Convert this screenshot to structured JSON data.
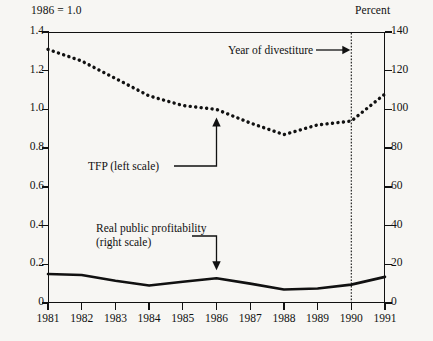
{
  "header": {
    "left_note": "1986 = 1.0",
    "right_note": "Percent"
  },
  "annotations": {
    "divestiture": "Year of divestiture",
    "tfp": "TFP (left scale)",
    "profit_line1": "Real public profitability",
    "profit_line2": "(right scale)"
  },
  "chart_data": {
    "type": "line",
    "title": "",
    "subtitle": "",
    "xlabel": "",
    "ylabel": "1986 = 1.0",
    "y2label": "Percent",
    "grid": false,
    "legend": "annotations-inline",
    "x": [
      1981,
      1982,
      1983,
      1984,
      1985,
      1986,
      1987,
      1988,
      1989,
      1990,
      1991
    ],
    "xtick_labels": [
      "1981",
      "1982",
      "1983",
      "1984",
      "1985",
      "1986",
      "1987",
      "1988",
      "1989",
      "1990",
      "1991"
    ],
    "xlim": [
      1981,
      1991
    ],
    "ylim": [
      0,
      1.4
    ],
    "ytick_labels": [
      "0",
      "0.2",
      "0.4",
      "0.6",
      "0.8",
      "1.0",
      "1.2",
      "1.4"
    ],
    "ytick_values": [
      0,
      0.2,
      0.4,
      0.6,
      0.8,
      1.0,
      1.2,
      1.4
    ],
    "y2lim": [
      0,
      140
    ],
    "y2tick_labels": [
      "0",
      "20",
      "40",
      "60",
      "80",
      "100",
      "120",
      "140"
    ],
    "y2tick_values": [
      0,
      20,
      40,
      60,
      80,
      100,
      120,
      140
    ],
    "vline": {
      "x": 1990,
      "label": "Year of divestiture",
      "style": "dotted"
    },
    "series": [
      {
        "name": "TFP (left scale)",
        "axis": "left",
        "style": "dotted",
        "color": "#111111",
        "values": [
          1.31,
          1.25,
          1.16,
          1.07,
          1.02,
          1.0,
          0.93,
          0.87,
          0.92,
          0.94,
          1.08
        ]
      },
      {
        "name": "Real public profitability (right scale)",
        "axis": "right",
        "style": "solid",
        "color": "#111111",
        "values_percent": [
          15.0,
          14.5,
          11.5,
          9.0,
          11.0,
          12.8,
          10.0,
          7.0,
          7.5,
          9.5,
          13.5
        ],
        "values_left_equivalent": [
          0.15,
          0.145,
          0.115,
          0.09,
          0.11,
          0.128,
          0.1,
          0.07,
          0.075,
          0.095,
          0.135
        ]
      }
    ]
  }
}
